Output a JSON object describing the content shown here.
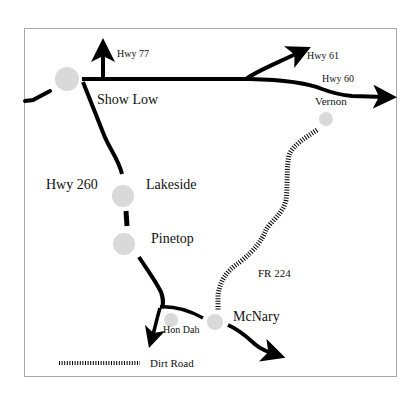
{
  "map": {
    "colors": {
      "road": "#000000",
      "town": "#d9d9d9",
      "frame": "#a8a8a8",
      "dirt_road": "#000000"
    },
    "towns": [
      {
        "name": "Show Low",
        "x": 67,
        "y": 79,
        "r": 12
      },
      {
        "name": "Lakeside",
        "x": 123,
        "y": 219,
        "r": 11
      },
      {
        "name": "Pinetop",
        "x": 126,
        "y": 245,
        "r": 11
      },
      {
        "name": "Hon Dah",
        "x": 171,
        "y": 320,
        "r": 7
      },
      {
        "name": "McNary",
        "x": 215,
        "y": 322,
        "r": 8
      },
      {
        "name": "Vernon",
        "x": 326,
        "y": 119,
        "r": 7
      }
    ],
    "labels": {
      "show_low": "Show Low",
      "lakeside": "Lakeside",
      "pinetop": "Pinetop",
      "hon_dah": "Hon Dah",
      "mcnary": "McNary",
      "vernon": "Vernon",
      "hwy77": "Hwy 77",
      "hwy61": "Hwy 61",
      "hwy60": "Hwy 60",
      "hwy260": "Hwy 260",
      "fr224": "FR 224"
    },
    "legend": {
      "dirt_road_label": "Dirt Road"
    }
  }
}
